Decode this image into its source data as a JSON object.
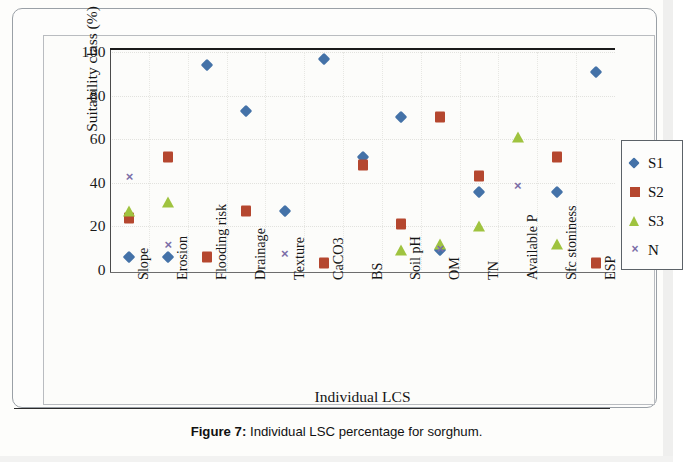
{
  "figure": {
    "caption_label": "Figure 7:",
    "caption_text": " Individual LSC percentage for sorghum."
  },
  "chart_data": {
    "type": "scatter",
    "title": "",
    "xlabel": "Individual LCS",
    "ylabel": "Suitability class (%)",
    "ylim": [
      0,
      100
    ],
    "yticks": [
      "0",
      "20",
      "40",
      "60",
      "80",
      "100"
    ],
    "grid": true,
    "legend_position": "right",
    "categories": [
      "Slope",
      "Erosion",
      "Flooding risk",
      "Drainage",
      "Texture",
      "CaCO3",
      "BS",
      "Soil pH",
      "OM",
      "TN",
      "Available P",
      "Sfc stoniness",
      "ESP"
    ],
    "series": [
      {
        "name": "S1",
        "color": "#4472a8",
        "marker": "diamond",
        "values": [
          6,
          6,
          94,
          73,
          27,
          97,
          52,
          70,
          9,
          36,
          null,
          36,
          91
        ]
      },
      {
        "name": "S2",
        "color": "#b5472f",
        "marker": "square",
        "values": [
          24,
          52,
          6,
          27,
          null,
          3,
          48,
          21,
          70,
          43,
          null,
          52,
          3
        ]
      },
      {
        "name": "S3",
        "color": "#9fc33f",
        "marker": "triangle",
        "values": [
          27,
          31,
          null,
          null,
          null,
          null,
          null,
          9,
          12,
          20,
          61,
          12,
          null
        ]
      },
      {
        "name": "N",
        "color": "#7b6ea8",
        "marker": "cross",
        "values": [
          43,
          12,
          null,
          null,
          8,
          null,
          null,
          null,
          10,
          null,
          39,
          null,
          null
        ]
      }
    ]
  }
}
